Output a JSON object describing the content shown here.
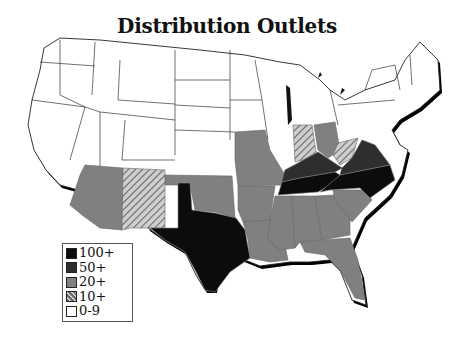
{
  "title": "Distribution Outlets",
  "legend": {
    "items": [
      {
        "label": "100+",
        "color": "#0c0c0c",
        "pattern": "solid"
      },
      {
        "label": "50+",
        "color": "#2e2e2e",
        "pattern": "solid"
      },
      {
        "label": "20+",
        "color": "#808080",
        "pattern": "solid"
      },
      {
        "label": "10+",
        "color": "#9a9a9a",
        "pattern": "hatch"
      },
      {
        "label": "0-9",
        "color": "#ffffff",
        "pattern": "solid"
      }
    ]
  },
  "map": {
    "region": "Contiguous United States",
    "categories": {
      "100+": [
        "Texas",
        "Tennessee",
        "North Carolina"
      ],
      "50+": [
        "Kentucky",
        "Virginia"
      ],
      "20+": [
        "Arizona",
        "Oklahoma",
        "Missouri",
        "Arkansas",
        "Louisiana",
        "Mississippi",
        "Alabama",
        "Georgia",
        "South Carolina",
        "Florida",
        "Ohio"
      ],
      "10+": [
        "New Mexico",
        "Indiana",
        "West Virginia"
      ],
      "0-9": [
        "all other states"
      ]
    }
  }
}
